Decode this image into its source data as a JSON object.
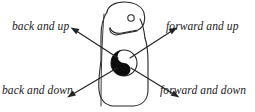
{
  "figure": {
    "kind": "direction-diagram",
    "stroke_color": "#262626",
    "ball_dark_color": "#0d0d0d",
    "ball_light_color": "#ffffff",
    "background_color": "#ffffff",
    "labels": {
      "back_and_up": "back and up",
      "forward_and_up": "forward and up",
      "back_and_down": "back and down",
      "forward_and_down": "forward and down"
    },
    "arrows": [
      {
        "name": "back-and-up",
        "direction": "up-left",
        "from": [
          118,
          58
        ],
        "to": [
          72,
          28
        ]
      },
      {
        "name": "forward-and-up",
        "direction": "up-right",
        "from": [
          130,
          58
        ],
        "to": [
          176,
          28
        ]
      },
      {
        "name": "back-and-down",
        "direction": "down-left",
        "from": [
          117,
          68
        ],
        "to": [
          68,
          97
        ]
      },
      {
        "name": "forward-and-down",
        "direction": "down-right",
        "from": [
          131,
          68
        ],
        "to": [
          178,
          97
        ]
      }
    ],
    "ball": {
      "cx": 124,
      "cy": 63,
      "r": 13
    },
    "eye": {
      "cx": 131,
      "cy": 18,
      "r": 3
    }
  }
}
